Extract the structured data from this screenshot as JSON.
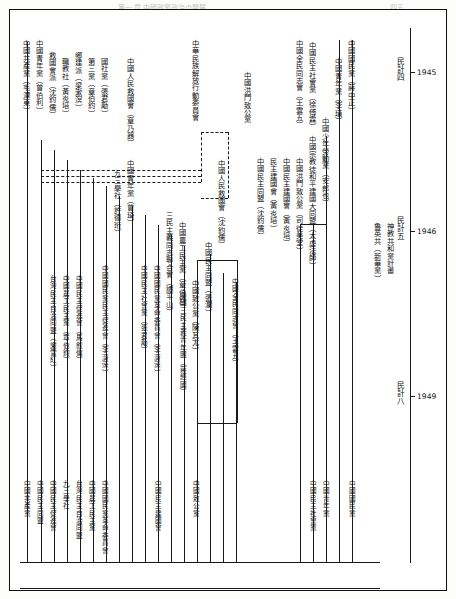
{
  "page": {
    "header_faint": "第一 章 中國政黨政治の発展",
    "header_page": "四五"
  },
  "timeline": {
    "axis_label": "年",
    "marks": [
      {
        "era": "民計四",
        "year": "1945"
      },
      {
        "era": "民計五",
        "year": "1946"
      },
      {
        "era": "民計八",
        "year": "1949"
      }
    ]
  },
  "branches_top": [
    {
      "id": "b01",
      "label": "中國共產黨（毛澤東）"
    },
    {
      "id": "b02",
      "label": "中國青年黨（曾伯利）"
    },
    {
      "id": "b03",
      "label": "救國會派（沈鈞儒）"
    },
    {
      "id": "b04",
      "label": "職教社（黃炎培）"
    },
    {
      "id": "b05",
      "label": "鄉建派（梁漱溟）"
    },
    {
      "id": "b06",
      "label": "第三黨（章伯鈞）"
    },
    {
      "id": "b07",
      "label": "國社黨（張君勱）"
    },
    {
      "id": "b08",
      "label": "中國民主社會黨（張君勱）"
    },
    {
      "id": "b09",
      "label": "中國人民救國會（章乃器）"
    },
    {
      "id": "b10",
      "label": "中國民主同盟（張瀾）"
    },
    {
      "id": "b11",
      "label": "中華民族解放行動委員會"
    },
    {
      "id": "b12",
      "label": "中國洪門致公黨"
    },
    {
      "id": "b13",
      "label": "中國民主建國會"
    },
    {
      "id": "b14",
      "label": "中國國民黨民主促進會"
    },
    {
      "id": "b15",
      "label": "中國國民黨革命委員會"
    },
    {
      "id": "b16",
      "label": "中國少年勞動黨（安郎也）"
    },
    {
      "id": "b17",
      "label": "中國致公黨"
    },
    {
      "id": "b18",
      "label": "中國青年黨（李璜）"
    },
    {
      "id": "b19",
      "label": "中國國民黨（蔣中正）"
    },
    {
      "id": "b20",
      "label": "中國民主社會黨（徐傅霖）"
    },
    {
      "id": "b21",
      "label": "中國全民同志會（王雲五）"
    }
  ],
  "inner_labels": [
    {
      "id": "i01",
      "label": "三民主義同志聯合會（譚平山）"
    },
    {
      "id": "i02",
      "label": "中國國民黨民主促進會（李濟深）"
    },
    {
      "id": "i03",
      "label": "中國民主同盟（沈鈞儒）"
    },
    {
      "id": "i04",
      "label": "民主建國會（黃炎培）"
    },
    {
      "id": "i05",
      "label": "台灣民主自治同盟（謝雪紅）"
    },
    {
      "id": "i06",
      "label": "中國農工民主黨（章伯鈞）"
    },
    {
      "id": "i07",
      "label": "中國人民救國會（沈鈞儒）"
    },
    {
      "id": "i08",
      "label": "中國民主促進會（馬叙倫）"
    },
    {
      "id": "i09",
      "label": "中國民主建國會（黃炎培）"
    },
    {
      "id": "i10",
      "label": "中國致公黨（陳其尤）"
    },
    {
      "id": "i11",
      "label": "九三學社（許德珩）"
    },
    {
      "id": "i12",
      "label": "中國農工民主黨（章伯鈞）"
    },
    {
      "id": "i13",
      "label": "中國民主同盟（張瀾）"
    },
    {
      "id": "i14",
      "label": "中國國民黨革命委員會（李濟深）"
    },
    {
      "id": "i15",
      "label": "中國青年黨（曾琦）"
    },
    {
      "id": "i16",
      "label": "中國民主社會黨（張君勱）"
    },
    {
      "id": "i17",
      "label": "中國洪門致公黨（司徒美堂）"
    },
    {
      "id": "i18",
      "label": "中國宗教徒和平建國大同盟（太虛法師）"
    },
    {
      "id": "i19",
      "label": "中國民主統一促進會（鄧學稼）"
    },
    {
      "id": "i20",
      "label": "中國三民主義青年團（蔣經國）"
    },
    {
      "id": "i21",
      "label": "中國全民同志會（王雲五）"
    },
    {
      "id": "i22",
      "label": "魯英共（新華黨）"
    },
    {
      "id": "i23",
      "label": "神教共和黨計畫"
    }
  ],
  "bottom_labels": [
    {
      "id": "x01",
      "label": "中國共產黨"
    },
    {
      "id": "x02",
      "label": "中國民主同盟"
    },
    {
      "id": "x03",
      "label": "中國民主促進會"
    },
    {
      "id": "x04",
      "label": "九三學社"
    },
    {
      "id": "x05",
      "label": "台灣民主自治同盟"
    },
    {
      "id": "x06",
      "label": "中國農工民主黨"
    },
    {
      "id": "x07",
      "label": "中國國民黨革命委員會"
    },
    {
      "id": "x08",
      "label": "中國民主建國會"
    },
    {
      "id": "x09",
      "label": "中國致公黨"
    },
    {
      "id": "x10",
      "label": "中國民主社會黨"
    },
    {
      "id": "x11",
      "label": "中國青年黨"
    },
    {
      "id": "x12",
      "label": "中國國民黨"
    },
    {
      "id": "x13",
      "label": "中國民主社會黨"
    }
  ]
}
